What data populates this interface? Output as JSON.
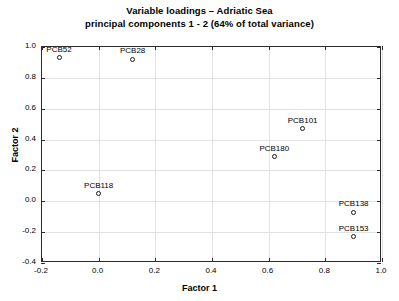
{
  "chart_data": {
    "type": "scatter",
    "title": "Variable loadings – Adriatic Sea",
    "subtitle": "principal components 1 - 2 (64% of total variance)",
    "xlabel": "Factor 1",
    "ylabel": "Factor 2",
    "xlim": [
      -0.2,
      1.0
    ],
    "ylim": [
      -0.4,
      1.0
    ],
    "xticks": [
      "-0.2",
      "0.0",
      "0.2",
      "0.4",
      "0.6",
      "0.8",
      "1.0"
    ],
    "xtick_values": [
      -0.2,
      0.0,
      0.2,
      0.4,
      0.6,
      0.8,
      1.0
    ],
    "yticks": [
      "-0.4",
      "-0.2",
      "0.0",
      "0.2",
      "0.4",
      "0.6",
      "0.8",
      "1.0"
    ],
    "ytick_values": [
      -0.4,
      -0.2,
      0.0,
      0.2,
      0.4,
      0.6,
      0.8,
      1.0
    ],
    "grid": true,
    "legend": "none",
    "marker": "open-circle",
    "points": [
      {
        "label": "PCB52",
        "x": -0.14,
        "y": 0.93,
        "label_pos": "above"
      },
      {
        "label": "PCB28",
        "x": 0.12,
        "y": 0.92,
        "label_pos": "above"
      },
      {
        "label": "PCB101",
        "x": 0.72,
        "y": 0.47,
        "label_pos": "above"
      },
      {
        "label": "PCB180",
        "x": 0.62,
        "y": 0.29,
        "label_pos": "above"
      },
      {
        "label": "PCB118",
        "x": 0.0,
        "y": 0.05,
        "label_pos": "above"
      },
      {
        "label": "PCB138",
        "x": 0.9,
        "y": -0.07,
        "label_pos": "above"
      },
      {
        "label": "PCB153",
        "x": 0.9,
        "y": -0.23,
        "label_pos": "above"
      }
    ]
  }
}
